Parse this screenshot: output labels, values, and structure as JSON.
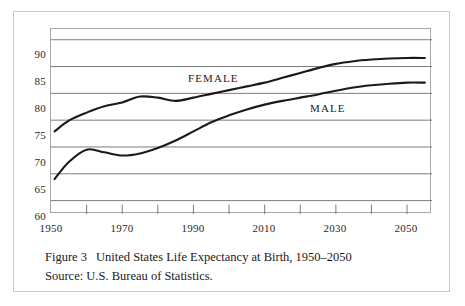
{
  "figure": {
    "caption_figure_number": "Figure 3",
    "caption_title": "United States Life Expectancy at Birth, 1950–2050",
    "caption_source": "Source: U.S. Bureau of Statistics."
  },
  "chart_data": {
    "type": "line",
    "title": "United States Life Expectancy at Birth, 1950–2050",
    "xlabel": "",
    "ylabel": "",
    "xlim": [
      1950,
      2057
    ],
    "ylim": [
      57.5,
      92
    ],
    "grid": true,
    "grid_axis": "y",
    "legend_position": "inline-annotation",
    "y_ticks": [
      90,
      85,
      80,
      75,
      70,
      65,
      60
    ],
    "y_tick_labels": [
      "90",
      "85",
      "80",
      "75",
      "70",
      "65",
      "60"
    ],
    "x_ticks": [
      1950,
      1960,
      1970,
      1980,
      1990,
      2000,
      2010,
      2020,
      2030,
      2040,
      2050
    ],
    "x_tick_labels_shown": [
      "1950",
      "1970",
      "1990",
      "2010",
      "2030",
      "2050"
    ],
    "x_labeled_ticks": [
      1950,
      1970,
      1990,
      2010,
      2030,
      2050
    ],
    "series": [
      {
        "name": "FEMALE",
        "color": "#1a1a1a",
        "x": [
          1951,
          1955,
          1960,
          1965,
          1970,
          1975,
          1980,
          1985,
          1990,
          1995,
          2000,
          2005,
          2010,
          2015,
          2020,
          2025,
          2030,
          2035,
          2040,
          2045,
          2050,
          2055
        ],
        "values": [
          72.9,
          74.9,
          76.4,
          77.6,
          78.3,
          79.4,
          79.2,
          78.6,
          79.2,
          79.9,
          80.6,
          81.3,
          82.0,
          82.9,
          83.8,
          84.7,
          85.5,
          86.0,
          86.3,
          86.5,
          86.6,
          86.6
        ]
      },
      {
        "name": "MALE",
        "color": "#1a1a1a",
        "x": [
          1951,
          1955,
          1960,
          1965,
          1970,
          1975,
          1980,
          1985,
          1990,
          1995,
          2000,
          2005,
          2010,
          2015,
          2020,
          2025,
          2030,
          2035,
          2040,
          2045,
          2050,
          2055
        ],
        "values": [
          64.0,
          67.2,
          69.5,
          69.0,
          68.4,
          68.8,
          69.8,
          71.2,
          72.9,
          74.6,
          75.9,
          77.0,
          77.9,
          78.6,
          79.2,
          79.8,
          80.5,
          81.1,
          81.5,
          81.8,
          82.0,
          82.0
        ]
      }
    ],
    "annotations": [
      {
        "text": "FEMALE",
        "x_px": 188,
        "y_px": 78
      },
      {
        "text": "MALE",
        "x_px": 310,
        "y_px": 108
      }
    ]
  },
  "axis_labels": {
    "y": [
      "90",
      "85",
      "80",
      "75",
      "70",
      "65",
      "60"
    ],
    "x": [
      "1950",
      "1970",
      "1990",
      "2010",
      "2030",
      "2050"
    ]
  }
}
